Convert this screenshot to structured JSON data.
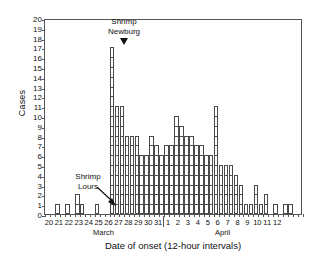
{
  "chart_data": {
    "type": "bar",
    "title": "",
    "xlabel": "Date of onset (12-hour intervals)",
    "ylabel": "Cases",
    "ylim": [
      0,
      20
    ],
    "ytick_step": 1,
    "grid": false,
    "interval": "12-hour",
    "bars_per_day": 2,
    "months": [
      {
        "name": "March",
        "days": [
          20,
          21,
          22,
          23,
          24,
          25,
          26,
          27,
          28,
          29,
          30,
          31
        ]
      },
      {
        "name": "April",
        "days": [
          1,
          2,
          3,
          4,
          5,
          6,
          7,
          8,
          9,
          10,
          11,
          12
        ]
      }
    ],
    "yticks": [
      0,
      1,
      2,
      3,
      4,
      5,
      6,
      7,
      8,
      9,
      10,
      11,
      12,
      13,
      14,
      15,
      16,
      17,
      18,
      19,
      20
    ],
    "xtick_labels": [
      "20",
      "21",
      "22",
      "23",
      "24",
      "25",
      "26",
      "27",
      "28",
      "29",
      "30",
      "31",
      "1",
      "2",
      "3",
      "4",
      "5",
      "6",
      "7",
      "8",
      "9",
      "10",
      "11",
      "12"
    ],
    "series_name": "Cases by 12-hour interval",
    "values": [
      0,
      0,
      1,
      0,
      1,
      0,
      2,
      1,
      0,
      0,
      1,
      0,
      0,
      17,
      11,
      11,
      8,
      8,
      8,
      6,
      6,
      8,
      7,
      6,
      7,
      7,
      10,
      9,
      8,
      8,
      7,
      7,
      6,
      6,
      11,
      5,
      5,
      5,
      4,
      3,
      1,
      1,
      3,
      1,
      2,
      0,
      1,
      0,
      1,
      1,
      0,
      0
    ],
    "annotations": [
      {
        "id": "shrimp-newburg",
        "lines": [
          "Shrimp",
          "Newburg"
        ],
        "marker": "down-arrow",
        "points_to": "March 26 PM (17 cases)"
      },
      {
        "id": "shrimp-lours",
        "lines": [
          "Shrimp",
          "Lours"
        ],
        "marker": "diagonal-arrow",
        "points_to": "March 26 AM"
      }
    ],
    "axis_color": "#555555",
    "bar_edge_color": "#4a4a4a",
    "bar_fill_color": "#ffffff"
  }
}
